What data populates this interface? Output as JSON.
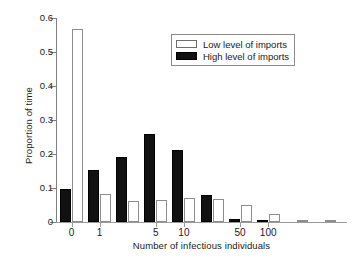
{
  "chart_data": {
    "type": "bar",
    "title": "",
    "subtitle": "",
    "xlabel": "Number of infectious individuals",
    "ylabel": "Proportion of time",
    "ylim": [
      0,
      0.6
    ],
    "ytick_labels": [
      "0",
      "0.1",
      "0.2",
      "0.3",
      "0.4",
      "0.5",
      "0.6"
    ],
    "ytick_values": [
      0,
      0.1,
      0.2,
      0.3,
      0.4,
      0.5,
      0.6
    ],
    "xtick_labels": [
      "0",
      "1",
      "5",
      "10",
      "50",
      "100"
    ],
    "xtick_bin_index": [
      0,
      1,
      3,
      4,
      6,
      7
    ],
    "grid": false,
    "legend_position": "upper right",
    "legend": [
      "Low level of imports",
      "High level of imports"
    ],
    "categories": [
      "0",
      "1",
      "2-4",
      "5-9",
      "10-19",
      "20-49",
      "50-99",
      "100-199",
      "200-499",
      "500+"
    ],
    "series": [
      {
        "name": "High level of imports",
        "color": "#111111",
        "style": "filled",
        "values": [
          0.098,
          0.154,
          0.191,
          0.26,
          0.213,
          0.078,
          0.008,
          0.002,
          0.0,
          0.0
        ]
      },
      {
        "name": "Low level of imports",
        "color": "#ffffff",
        "style": "outlined",
        "values": [
          0.568,
          0.082,
          0.061,
          0.066,
          0.07,
          0.069,
          0.05,
          0.024,
          0.005,
          0.002
        ]
      }
    ]
  },
  "axes": {
    "y_title": "Proportion of time",
    "x_title": "Number of infectious individuals"
  },
  "legend": {
    "entries": [
      {
        "label": "Low level of imports",
        "swatch": "open-square-swatch"
      },
      {
        "label": "High level of imports",
        "swatch": "filled-square-swatch"
      }
    ]
  }
}
